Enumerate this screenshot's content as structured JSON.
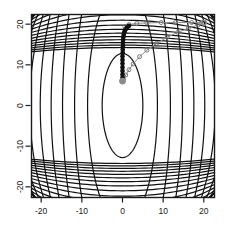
{
  "figure": {
    "kind": "contour-plot-with-optimization-path",
    "background_color": "#ffffff",
    "plot_box": {
      "left": 31,
      "top": 14,
      "right": 214,
      "bottom": 197
    },
    "box_color": "#1a1a1a"
  },
  "chart_data": {
    "type": "line",
    "title": "",
    "subtitle": "",
    "xlabel": "",
    "ylabel": "",
    "xlim": [
      -22.5,
      22.5
    ],
    "ylim": [
      -22.5,
      22.5
    ],
    "grid": false,
    "legend": null,
    "xticks": [
      -20,
      -10,
      0,
      10,
      20
    ],
    "xtick_labels": [
      "-20",
      "-10",
      "0",
      "10",
      "20"
    ],
    "yticks": [
      -20,
      -10,
      0,
      10,
      20
    ],
    "ytick_labels": [
      "-20",
      "-10",
      "0",
      "10",
      "20"
    ],
    "contour": {
      "description": "Nested elliptical/parabolic level curves of a quadratic-like objective centred near (0,0), elongated vertically and opening toward the left and right edges.",
      "color": "#111111",
      "line_width": 1.2,
      "n_levels": 24,
      "center": [
        0,
        0
      ],
      "inner_ellipse_semi_axes": [
        5.0,
        12.8
      ],
      "levels": [
        1,
        2,
        3,
        4,
        5,
        6,
        7,
        8,
        9,
        10,
        11,
        12,
        13,
        14,
        15,
        16,
        17,
        18,
        19,
        20,
        21,
        22,
        23,
        24
      ]
    },
    "series": [
      {
        "name": "optimization-path",
        "color": "#8c8c8c",
        "marker": "circle",
        "marker_color": "#6e6e6e",
        "line_width": 1.0,
        "x": [
          0.0,
          0.3,
          0.8,
          1.6,
          2.6,
          4.2,
          6.0,
          8.4,
          11.0,
          13.6,
          16.2,
          18.6,
          20.0,
          17.0,
          13.0,
          9.5,
          6.0,
          3.5,
          1.6,
          0.6
        ],
        "y": [
          6.0,
          6.6,
          7.5,
          8.8,
          10.2,
          12.0,
          13.6,
          15.3,
          16.8,
          18.0,
          19.0,
          19.8,
          20.4,
          20.4,
          20.4,
          20.4,
          20.3,
          20.2,
          19.9,
          19.4
        ]
      },
      {
        "name": "dense-iterate-cluster",
        "color": "#111111",
        "marker": "circle",
        "marker_color": "#111111",
        "line_width": 2.4,
        "description": "Tightly packed iterates forming a near-vertical dark bar at x~0 between y~6 and y~19, curving slightly right at the top.",
        "x": [
          0.0,
          0.0,
          0.0,
          0.0,
          0.0,
          0.0,
          0.0,
          0.0,
          0.05,
          0.05,
          0.1,
          0.1,
          0.15,
          0.2,
          0.3,
          0.45,
          0.6,
          0.9,
          1.2,
          1.6
        ],
        "y": [
          6.0,
          6.8,
          7.6,
          8.5,
          9.4,
          10.3,
          11.2,
          12.1,
          13.0,
          13.8,
          14.6,
          15.4,
          16.1,
          16.8,
          17.4,
          18.0,
          18.5,
          18.9,
          19.3,
          19.6
        ]
      }
    ],
    "start_point": {
      "x": 0.0,
      "y": 6.0,
      "marker": "filled-circle",
      "color": "#8c8c8c"
    },
    "end_point": {
      "x": 20.0,
      "y": 20.4,
      "marker": "circle",
      "color": "#8c8c8c"
    }
  }
}
